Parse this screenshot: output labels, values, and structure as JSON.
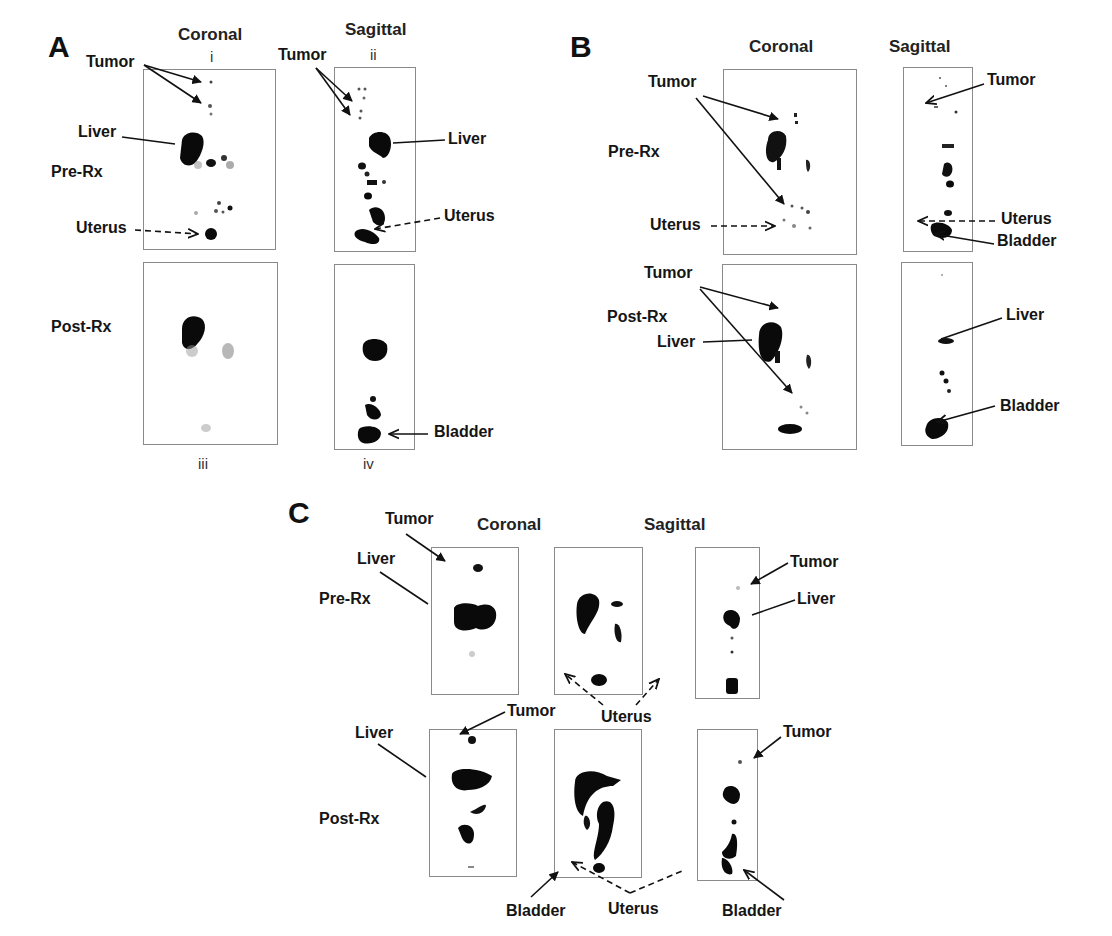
{
  "panels": {
    "A": {
      "letter": "A",
      "headers": {
        "coronal": "Coronal",
        "sagittal": "Sagittal"
      },
      "roman": {
        "i": "i",
        "ii": "ii",
        "iii": "iii",
        "iv": "iv"
      },
      "rows": {
        "pre": "Pre-Rx",
        "post": "Post-Rx"
      },
      "labels": {
        "tumor_coronal": "Tumor",
        "tumor_sagittal": "Tumor",
        "liver_coronal": "Liver",
        "liver_sagittal": "Liver",
        "uterus_coronal": "Uterus",
        "uterus_sagittal": "Uterus",
        "bladder_sagittal": "Bladder"
      }
    },
    "B": {
      "letter": "B",
      "headers": {
        "coronal": "Coronal",
        "sagittal": "Sagittal"
      },
      "rows": {
        "pre": "Pre-Rx",
        "post": "Post-Rx"
      },
      "labels": {
        "tumor_pre_coronal": "Tumor",
        "uterus_pre_coronal": "Uterus",
        "tumor_pre_sagittal": "Tumor",
        "uterus_pre_sagittal": "Uterus",
        "bladder_pre_sagittal": "Bladder",
        "tumor_post_coronal": "Tumor",
        "liver_post_coronal": "Liver",
        "liver_post_sagittal": "Liver",
        "bladder_post_sagittal": "Bladder"
      }
    },
    "C": {
      "letter": "C",
      "headers": {
        "coronal": "Coronal",
        "sagittal": "Sagittal"
      },
      "rows": {
        "pre": "Pre-Rx",
        "post": "Post-Rx"
      },
      "labels": {
        "tumor_pre_coronal": "Tumor",
        "liver_pre_coronal": "Liver",
        "tumor_pre_sagittal": "Tumor",
        "liver_pre_sagittal": "Liver",
        "uterus_middle": "Uterus",
        "tumor_post_coronal": "Tumor",
        "liver_post_coronal": "Liver",
        "tumor_post_sagittal": "Tumor",
        "bladder_post_coronal": "Bladder",
        "uterus_post": "Uterus",
        "bladder_post_sagittal": "Bladder"
      }
    }
  }
}
